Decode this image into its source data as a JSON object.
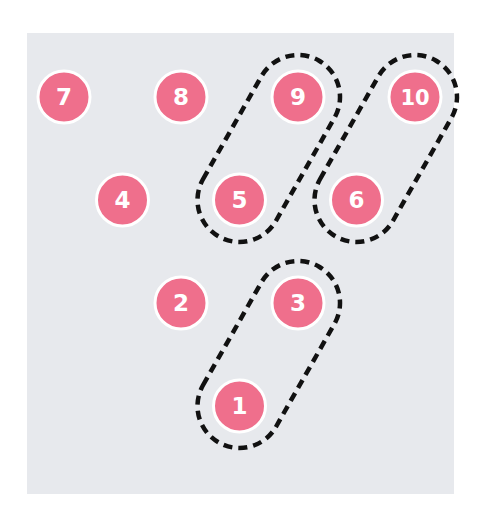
{
  "diagram": {
    "background_color": "#e7e9ed",
    "node_color": "#ef6f8c",
    "node_border_color": "#ffffff",
    "label_color": "#ffffff",
    "group_outline_color": "#111111",
    "nodes": [
      {
        "id": "1",
        "label": "1",
        "row": 3,
        "col": 1.5
      },
      {
        "id": "2",
        "label": "2",
        "row": 2,
        "col": 1
      },
      {
        "id": "3",
        "label": "3",
        "row": 2,
        "col": 2
      },
      {
        "id": "4",
        "label": "4",
        "row": 1,
        "col": 0.5
      },
      {
        "id": "5",
        "label": "5",
        "row": 1,
        "col": 1.5
      },
      {
        "id": "6",
        "label": "6",
        "row": 1,
        "col": 2.5
      },
      {
        "id": "7",
        "label": "7",
        "row": 0,
        "col": 0
      },
      {
        "id": "8",
        "label": "8",
        "row": 0,
        "col": 1
      },
      {
        "id": "9",
        "label": "9",
        "row": 0,
        "col": 2
      },
      {
        "id": "10",
        "label": "10",
        "row": 0,
        "col": 3
      }
    ],
    "groups": [
      {
        "name": "group-5-9",
        "members": [
          "5",
          "9"
        ]
      },
      {
        "name": "group-6-10",
        "members": [
          "6",
          "10"
        ]
      },
      {
        "name": "group-1-3",
        "members": [
          "1",
          "3"
        ]
      }
    ]
  }
}
